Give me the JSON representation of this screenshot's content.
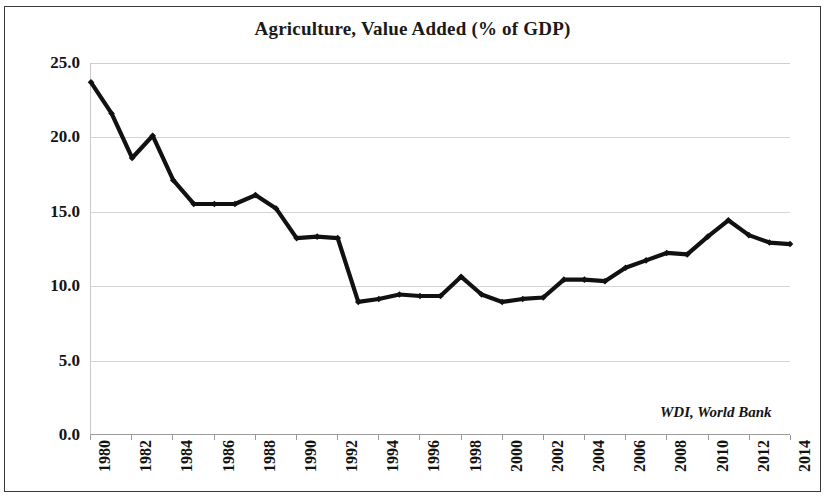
{
  "chart_data": {
    "type": "line",
    "title": "Agriculture, Value Added (% of GDP)",
    "xlabel": "",
    "ylabel": "",
    "xlim": [
      1980,
      2014
    ],
    "ylim": [
      0.0,
      25.0
    ],
    "grid": true,
    "legend": "none",
    "annotation": "WDI, World Bank",
    "y_ticks": [
      "0.0",
      "5.0",
      "10.0",
      "15.0",
      "20.0",
      "25.0"
    ],
    "y_tick_values": [
      0.0,
      5.0,
      10.0,
      15.0,
      20.0,
      25.0
    ],
    "x_tick_labels": [
      "1980",
      "1982",
      "1984",
      "1986",
      "1988",
      "1990",
      "1992",
      "1994",
      "1996",
      "1998",
      "2000",
      "2002",
      "2004",
      "2006",
      "2008",
      "2010",
      "2012",
      "2014"
    ],
    "x": [
      1980,
      1981,
      1982,
      1983,
      1984,
      1985,
      1986,
      1987,
      1988,
      1989,
      1990,
      1991,
      1992,
      1993,
      1994,
      1995,
      1996,
      1997,
      1998,
      1999,
      2000,
      2001,
      2002,
      2003,
      2004,
      2005,
      2006,
      2007,
      2008,
      2009,
      2010,
      2011,
      2012,
      2013,
      2014
    ],
    "values": [
      23.7,
      21.6,
      18.6,
      20.1,
      17.1,
      15.5,
      15.5,
      15.5,
      16.1,
      15.2,
      13.2,
      13.3,
      13.2,
      8.9,
      9.1,
      9.4,
      9.3,
      9.3,
      10.6,
      9.4,
      8.9,
      9.1,
      9.2,
      10.4,
      10.4,
      10.3,
      11.2,
      11.7,
      12.2,
      12.1,
      13.3,
      14.4,
      13.4,
      12.9,
      12.8
    ],
    "series_name": "Agriculture, value added (% of GDP)",
    "line_color": "#111111",
    "marker": "diamond"
  },
  "figure": {
    "background": "#ffffff",
    "border_color": "#3a3a3a"
  }
}
